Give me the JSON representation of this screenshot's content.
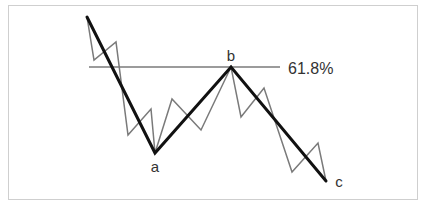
{
  "diagram": {
    "title": "",
    "retracement_label": "61.8%",
    "points": {
      "a": {
        "label": "a",
        "x": 155,
        "y": 153
      },
      "b": {
        "label": "b",
        "x": 231,
        "y": 67
      },
      "c": {
        "label": "c",
        "x": 326,
        "y": 181
      }
    },
    "start_point": {
      "x": 87,
      "y": 17
    },
    "retracement_line": {
      "x1": 89,
      "x2": 280,
      "y": 67,
      "color": "#7a7a7a"
    },
    "primary_wave": {
      "name": "corrective-abc",
      "color": "#111111",
      "stroke_width": 3,
      "points": [
        [
          87,
          17
        ],
        [
          155,
          153
        ],
        [
          231,
          67
        ],
        [
          326,
          181
        ]
      ]
    },
    "sub_waves": {
      "name": "sub-wave-zigzag",
      "color": "#7a7a7a",
      "stroke_width": 1.5,
      "points": [
        [
          87,
          17
        ],
        [
          94,
          60
        ],
        [
          116,
          42
        ],
        [
          128,
          135
        ],
        [
          151,
          109
        ],
        [
          155,
          153
        ],
        [
          172,
          99
        ],
        [
          201,
          130
        ],
        [
          231,
          67
        ],
        [
          241,
          117
        ],
        [
          264,
          88
        ],
        [
          292,
          172
        ],
        [
          318,
          143
        ],
        [
          326,
          181
        ]
      ]
    },
    "frame_color": "#cfcfcf"
  },
  "labels": {
    "a": "a",
    "b": "b",
    "c": "c",
    "fib": "61.8%"
  }
}
